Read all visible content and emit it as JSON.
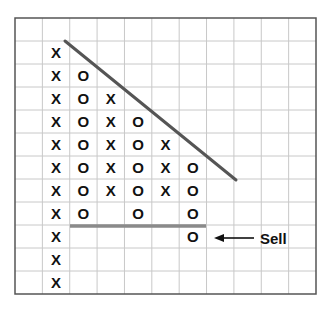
{
  "chart_data": {
    "type": "point-and-figure",
    "title": "",
    "grid": {
      "left": 15,
      "top": 18,
      "right": 316,
      "bottom": 294,
      "cols": 11,
      "rows": 12,
      "line_color": "#c8c8c8",
      "border_color": "#555555"
    },
    "columns": [
      {
        "col": 1,
        "symbol": "X",
        "rows": [
          1,
          2,
          3,
          4,
          5,
          6,
          7,
          8,
          9,
          10,
          11
        ]
      },
      {
        "col": 2,
        "symbol": "O",
        "rows": [
          2,
          3,
          4,
          5,
          6,
          7,
          8
        ]
      },
      {
        "col": 3,
        "symbol": "X",
        "rows": [
          3,
          4,
          5,
          6,
          7
        ]
      },
      {
        "col": 4,
        "symbol": "O",
        "rows": [
          4,
          5,
          6,
          7,
          8
        ]
      },
      {
        "col": 5,
        "symbol": "X",
        "rows": [
          5,
          6,
          7
        ]
      },
      {
        "col": 6,
        "symbol": "O",
        "rows": [
          6,
          7,
          8,
          9
        ]
      }
    ],
    "trendline": {
      "x1": 65,
      "y1": 41,
      "x2": 236,
      "y2": 180,
      "color": "#555555",
      "label": "downtrend line"
    },
    "support_line": {
      "x1": 70,
      "y1": 226,
      "x2": 206,
      "y2": 226,
      "color": "#8a8a8a",
      "label": "support"
    },
    "annotations": [
      {
        "text": "Sell",
        "arrow_from_x": 268,
        "arrow_to_x": 214,
        "y": 238,
        "text_x": 260
      }
    ]
  }
}
